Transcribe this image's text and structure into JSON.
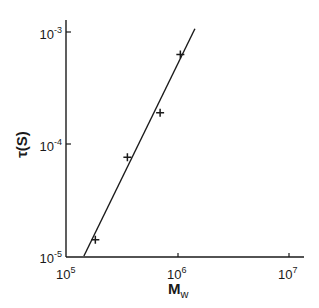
{
  "chart_data": {
    "type": "scatter",
    "title": "",
    "xlabel": "Mw",
    "ylabel": "τ(S)",
    "xscale": "log",
    "yscale": "log",
    "xlim": [
      100000,
      10000000
    ],
    "ylim": [
      1e-05,
      0.001
    ],
    "grid": false,
    "legend": null,
    "x_ticks": [
      {
        "value": 100000,
        "base": "10",
        "exp": "5"
      },
      {
        "value": 1000000,
        "base": "10",
        "exp": "6"
      },
      {
        "value": 10000000,
        "base": "10",
        "exp": "7"
      }
    ],
    "y_ticks": [
      {
        "value": 1e-05,
        "base": "10",
        "exp": "-5"
      },
      {
        "value": 0.0001,
        "base": "10",
        "exp": "-4"
      },
      {
        "value": 0.001,
        "base": "10",
        "exp": "-3"
      }
    ],
    "series": [
      {
        "name": "data",
        "marker": "+",
        "x": [
          180000,
          350000,
          690000,
          1050000
        ],
        "y": [
          1.4e-05,
          7.6e-05,
          0.00019,
          0.00063
        ]
      },
      {
        "name": "fit",
        "style": "line",
        "x": [
          142000,
          1420000
        ],
        "y": [
          1e-05,
          0.00107
        ]
      }
    ]
  },
  "colors": {
    "ink": "#1a1a1a",
    "background": "#ffffff"
  }
}
